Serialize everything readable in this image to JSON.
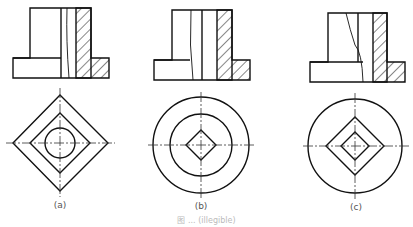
{
  "figure": {
    "type": "engineering-drawing",
    "views": [
      {
        "id": "a",
        "label": "(a)",
        "top_view": "section with hatched wall and flange",
        "bottom_view": "square outline, inner square, central round hole"
      },
      {
        "id": "b",
        "label": "(b)",
        "top_view": "section with hatched wall and flange",
        "bottom_view": "outer circle, inner circle, central square hole"
      },
      {
        "id": "c",
        "label": "(c)",
        "top_view": "section with hatched wall and flange",
        "bottom_view": "outer circle, large square, small square hole"
      }
    ],
    "caption": "图 ... (illegible)",
    "colors": {
      "line": "#111111",
      "center_line": "#333333",
      "background": "#ffffff"
    }
  }
}
